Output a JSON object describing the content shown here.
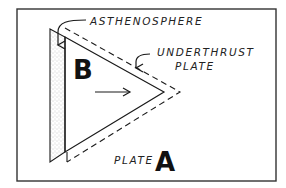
{
  "diagram": {
    "labels": {
      "asthenosphere": "ASTHENOSPHERE",
      "underthrust_line1": "UNDERTHRUST",
      "underthrust_line2": "PLATE",
      "plate_b": "B",
      "plate_a_word": "PLATE",
      "plate_a_letter": "A"
    },
    "colors": {
      "ink": "#1a1a1a",
      "frame": "#333333",
      "stipple": "#888888",
      "background": "#ffffff"
    },
    "elements": {
      "frame": {
        "x": 17,
        "y": 9,
        "width": 259,
        "height": 172
      },
      "asthenosphere_band": {
        "description": "stippled vertical band left of plate B"
      },
      "plate_b_triangle": {
        "description": "triangle pointing right representing plate B"
      },
      "underthrust_outline": {
        "description": "dashed outline of underthrust plate"
      },
      "motion_arrow": {
        "direction": "right"
      }
    }
  }
}
